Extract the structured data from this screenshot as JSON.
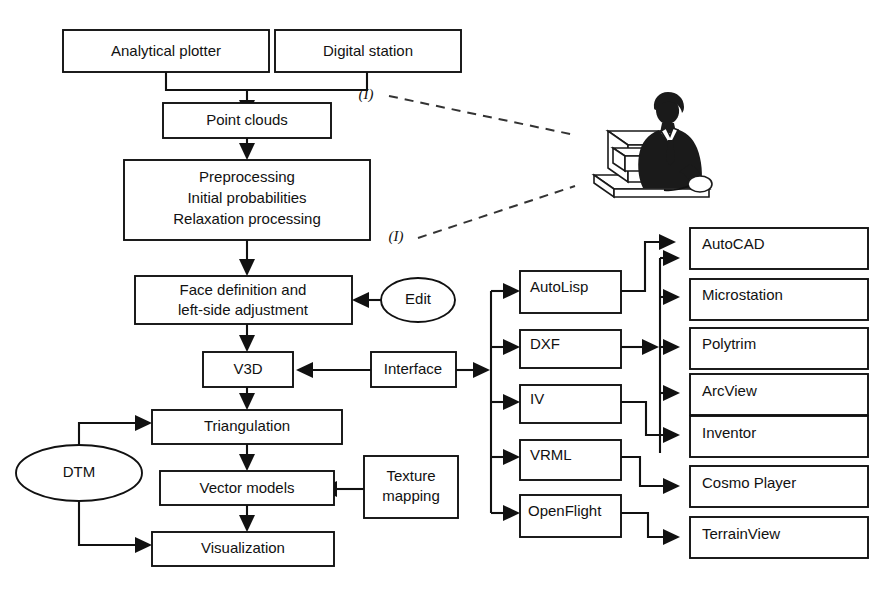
{
  "diagram": {
    "colors": {
      "stroke": "#111111",
      "background": "#ffffff",
      "dashed_stroke": "#333333",
      "illustration": "#1a1a1a"
    },
    "nodes": {
      "analytical_plotter": "Analytical plotter",
      "digital_station": "Digital station",
      "point_clouds": "Point clouds",
      "preprocessing_line1": "Preprocessing",
      "preprocessing_line2": "Initial probabilities",
      "preprocessing_line3": "Relaxation processing",
      "face_definition_line1": "Face definition and",
      "face_definition_line2": "left-side adjustment",
      "edit": "Edit",
      "v3d": "V3D",
      "interface": "Interface",
      "triangulation": "Triangulation",
      "vector_models": "Vector models",
      "visualization": "Visualization",
      "dtm": "DTM",
      "texture_mapping_line1": "Texture",
      "texture_mapping_line2": "mapping",
      "autolisp": "AutoLisp",
      "dxf": "DXF",
      "iv": "IV",
      "vrml": "VRML",
      "openflight": "OpenFlight",
      "autocad": "AutoCAD",
      "microstation": "Microstation",
      "polytrim": "Polytrim",
      "arcview": "ArcView",
      "inventor": "Inventor",
      "cosmo_player": "Cosmo Player",
      "terrainview": "TerrainView"
    },
    "annotations": {
      "marker_top": "(I)",
      "marker_bottom": "(I)"
    },
    "illustration": {
      "name": "operator-at-computer-workstation"
    }
  }
}
